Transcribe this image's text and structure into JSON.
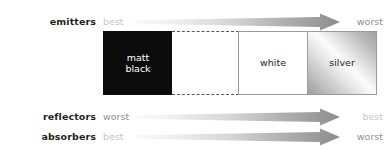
{
  "figure": {
    "rows": [
      {
        "label": "emitters",
        "left_text": "best",
        "right_text": "worst",
        "left_tone": "light",
        "right_tone": "dark"
      },
      {
        "label": "reflectors",
        "left_text": "worst",
        "right_text": "best",
        "left_tone": "dark",
        "right_tone": "light"
      },
      {
        "label": "absorbers",
        "left_text": "best",
        "right_text": "worst",
        "left_tone": "light",
        "right_tone": "dark"
      }
    ],
    "strip": {
      "cells": [
        {
          "label": "matt\nblack",
          "line1": "matt",
          "line2": "black",
          "swatch": "matt-black",
          "color": "#0b0b0b"
        },
        {
          "label": "",
          "swatch": "unlabelled-white-dashed",
          "color": "#ffffff"
        },
        {
          "label": "white",
          "swatch": "white",
          "color": "#ffffff"
        },
        {
          "label": "silver",
          "swatch": "silver",
          "color": "#c9c9c9"
        }
      ]
    },
    "colors": {
      "label_text": "#231f20",
      "tone_light": "#c6c6c6",
      "tone_dark": "#8f8f8f",
      "arrow_start": "#f2f2f2",
      "arrow_end": "#8c8c8c",
      "cell_border": "#9a9a9a",
      "dashed_border": "#555555",
      "background": "#ffffff"
    }
  }
}
